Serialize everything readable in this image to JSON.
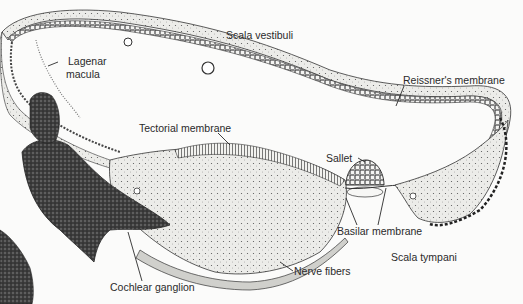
{
  "figure": {
    "labels": {
      "scala_vestibuli": "Scala vestibuli",
      "lagenar_macula_line1": "Lagenar",
      "lagenar_macula_line2": "macula",
      "reissners_membrane": "Reissner's membrane",
      "tectorial_membrane": "Tectorial membrane",
      "sallet": "Sallet",
      "basilar_membrane": "Basilar membrane",
      "scala_tympani": "Scala tympani",
      "nerve_fibers": "Nerve fibers",
      "cochlear_ganglion": "Cochlear ganglion"
    },
    "colors": {
      "ink": "#2a2a2a",
      "stipple_fill": "#e9e9e6",
      "dark_tissue": "#3a3a3a",
      "background": "#fbfbfa"
    }
  }
}
